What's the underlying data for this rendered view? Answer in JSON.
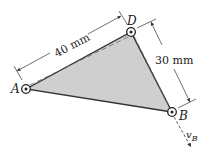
{
  "diagram": {
    "points": {
      "A": {
        "label": "A",
        "x": 26,
        "y": 89
      },
      "D": {
        "label": "D",
        "x": 131,
        "y": 32
      },
      "B": {
        "label": "B",
        "x": 172,
        "y": 112
      }
    },
    "dimensions": {
      "AD": "40 mm",
      "DB": "30 mm"
    },
    "velocity_label": "v",
    "velocity_subscript": "B",
    "colors": {
      "plate_fill": "#c8c8c8",
      "line": "#333333",
      "dash": "#555555"
    }
  }
}
